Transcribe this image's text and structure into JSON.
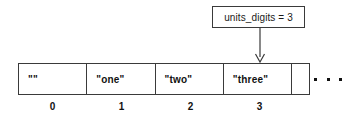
{
  "diagram": {
    "type": "array-index-callout",
    "callout": {
      "text": "units_digits = 3",
      "variable": "units_digits",
      "value": "3",
      "points_to_index": "3",
      "arrow_icon": "arrow-down-icon"
    },
    "array": {
      "cells": [
        {
          "value": "\"\"",
          "index": "0"
        },
        {
          "value": "\"one\"",
          "index": "1"
        },
        {
          "value": "\"two\"",
          "index": "2"
        },
        {
          "value": "\"three\"",
          "index": "3"
        }
      ],
      "truncated_cell": {
        "value": ""
      },
      "continuation": "..."
    },
    "colors": {
      "stroke": "#3a3a3a",
      "text": "#111111",
      "background": "#ffffff"
    }
  }
}
